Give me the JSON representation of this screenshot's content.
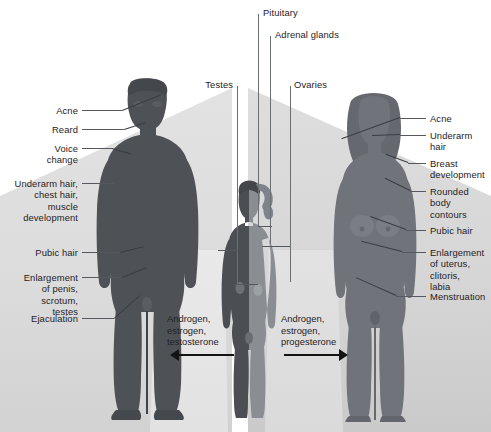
{
  "diagram": {
    "colors": {
      "male_figure": "#4e5256",
      "female_figure": "#70747a",
      "child_left": "#4b4f53",
      "child_right": "#8a8e93",
      "wedge_light": "#dedede",
      "pale_panel": "#e6e6e6",
      "text": "#1f2124",
      "leader_line": "#55585c"
    }
  },
  "top_labels": [
    {
      "id": "pituitary",
      "text": "Pituitary"
    },
    {
      "id": "adrenal-glands",
      "text": "Adrenal glands"
    }
  ],
  "gonad_labels": [
    {
      "id": "testes",
      "text": "Testes"
    },
    {
      "id": "ovaries",
      "text": "Ovaries"
    }
  ],
  "male_labels": [
    {
      "id": "acne",
      "text": "Acne"
    },
    {
      "id": "beard",
      "text": "Reard"
    },
    {
      "id": "voice-change",
      "text": "Voice\nchange"
    },
    {
      "id": "underarm-chest-muscle",
      "text": "Underarm hair,\nchest hair,\nmuscle\ndevelopment"
    },
    {
      "id": "pubic-hair",
      "text": "Pubic hair"
    },
    {
      "id": "enlargement-penis",
      "text": "Enlargement\nof penis,\nscrotum,\ntestes"
    },
    {
      "id": "ejaculation",
      "text": "Ejaculation"
    }
  ],
  "female_labels": [
    {
      "id": "acne",
      "text": "Acne"
    },
    {
      "id": "underarm-hair",
      "text": "Underarm\nhair"
    },
    {
      "id": "breast-development",
      "text": "Breast\ndevelopment"
    },
    {
      "id": "rounded-body-contours",
      "text": "Rounded\nbody\ncontours"
    },
    {
      "id": "pubic-hair",
      "text": "Pubic hair"
    },
    {
      "id": "enlargement-uterus",
      "text": "Enlargement\nof uterus,\nclitoris,\nlabia"
    },
    {
      "id": "menstruation",
      "text": "Menstruation"
    }
  ],
  "hormones": {
    "male": {
      "text": "Androgen,\nestrogen,\ntestosterone",
      "direction": "left"
    },
    "female": {
      "text": "Androgen,\nestrogen,\nprogesterone",
      "direction": "right"
    }
  }
}
